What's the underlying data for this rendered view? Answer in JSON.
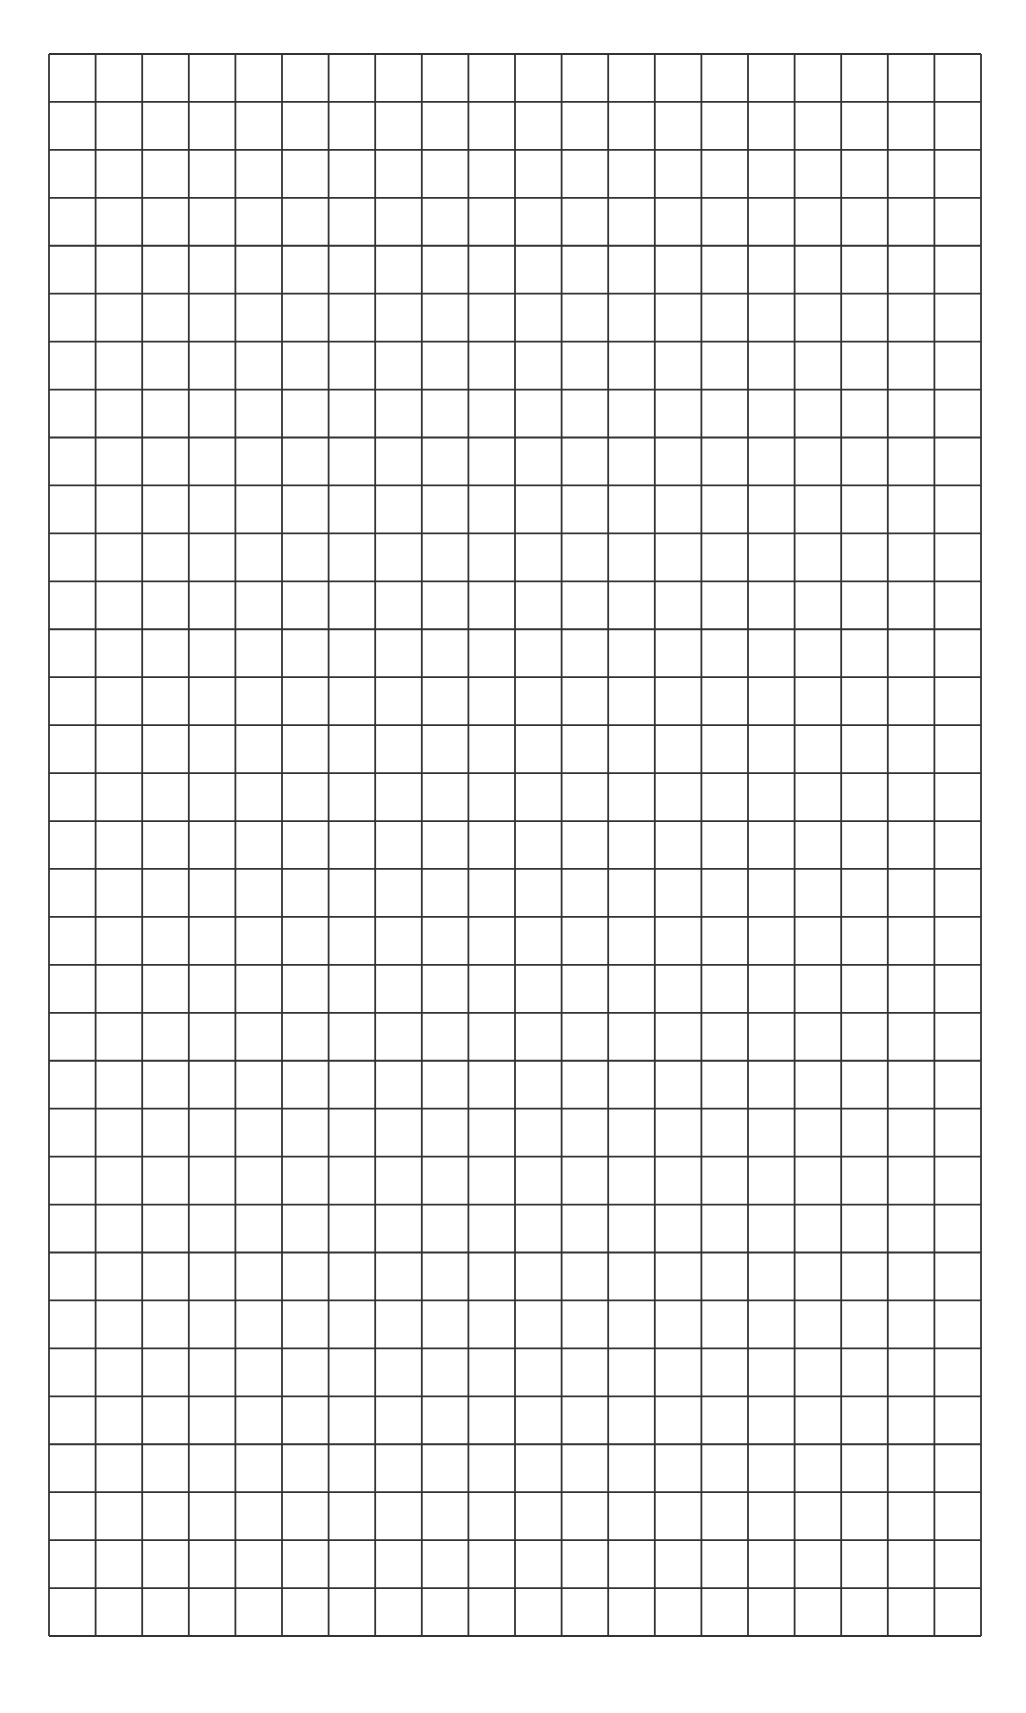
{
  "page": {
    "background": "#ffffff"
  },
  "grid": {
    "columns": 20,
    "rows": 33,
    "left": 49,
    "top": 54,
    "width": 932,
    "height": 1582,
    "line_color": "#333333",
    "line_width": 1.8
  }
}
